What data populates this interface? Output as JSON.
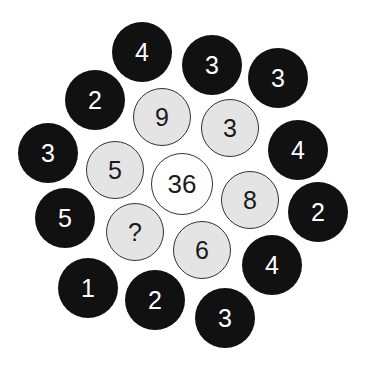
{
  "puzzle": {
    "center": {
      "value": "36",
      "x": 182,
      "y": 184
    },
    "inner_ring": [
      {
        "value": "9",
        "x": 162,
        "y": 117
      },
      {
        "value": "3",
        "x": 230,
        "y": 128
      },
      {
        "value": "8",
        "x": 250,
        "y": 200
      },
      {
        "value": "6",
        "x": 202,
        "y": 250
      },
      {
        "value": "?",
        "x": 135,
        "y": 232
      },
      {
        "value": "5",
        "x": 115,
        "y": 170
      }
    ],
    "outer_ring": [
      {
        "value": "4",
        "x": 142,
        "y": 52
      },
      {
        "value": "3",
        "x": 212,
        "y": 65
      },
      {
        "value": "3",
        "x": 278,
        "y": 78
      },
      {
        "value": "4",
        "x": 298,
        "y": 150
      },
      {
        "value": "2",
        "x": 318,
        "y": 212
      },
      {
        "value": "4",
        "x": 272,
        "y": 265
      },
      {
        "value": "3",
        "x": 225,
        "y": 318
      },
      {
        "value": "2",
        "x": 155,
        "y": 300
      },
      {
        "value": "1",
        "x": 88,
        "y": 288
      },
      {
        "value": "5",
        "x": 65,
        "y": 218
      },
      {
        "value": "3",
        "x": 48,
        "y": 153
      },
      {
        "value": "2",
        "x": 95,
        "y": 100
      }
    ],
    "colors": {
      "outer_fill": "#111111",
      "inner_fill": "#e4e4e4",
      "center_fill": "#ffffff"
    }
  }
}
